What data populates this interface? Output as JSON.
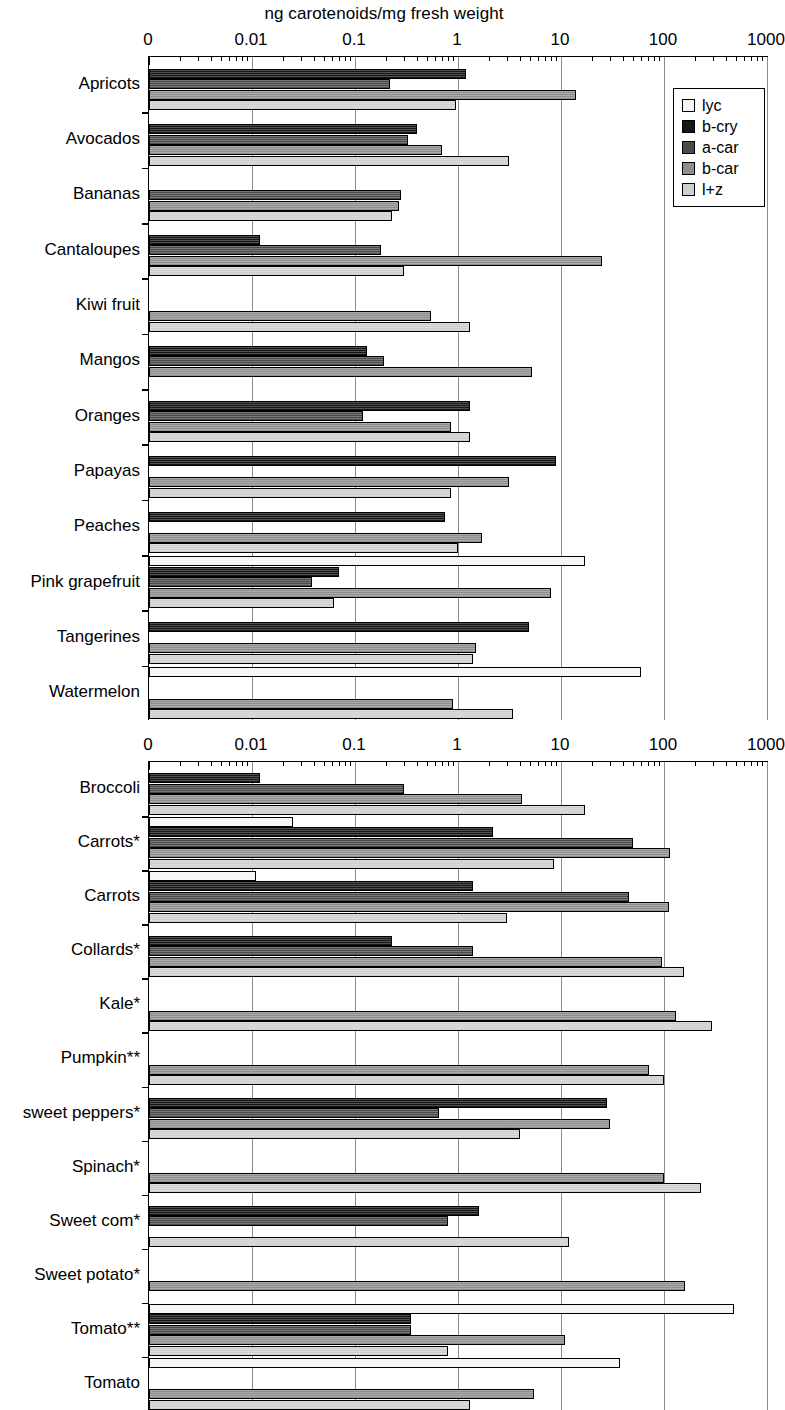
{
  "figure": {
    "axis_title": "ng carotenoids/mg fresh weight"
  },
  "legend": {
    "position": "top-right of upper panel",
    "entries": [
      {
        "key": "lyc",
        "label": "lyc",
        "color": "#f4f4f4"
      },
      {
        "key": "b-cry",
        "label": "b-cry",
        "color": "#161616"
      },
      {
        "key": "a-car",
        "label": "a-car",
        "color": "#4a4a4a"
      },
      {
        "key": "b-car",
        "label": "b-car",
        "color": "#8e8e8e"
      },
      {
        "key": "l+z",
        "label": "l+z",
        "color": "#cfcfcf"
      }
    ]
  },
  "chart_data": [
    {
      "id": "fruits",
      "type": "bar",
      "orientation": "horizontal",
      "title": "",
      "xlabel": "ng carotenoids/mg fresh weight",
      "ylabel": "",
      "xscale": "log",
      "xlim": [
        0.001,
        1000
      ],
      "xticks": [
        "0",
        "0.01",
        "0.1",
        "1",
        "10",
        "100",
        "1000"
      ],
      "xtick_values": [
        0.001,
        0.01,
        0.1,
        1,
        10,
        100,
        1000
      ],
      "grid": true,
      "legend": [
        "lyc",
        "b-cry",
        "a-car",
        "b-car",
        "l+z"
      ],
      "categories": [
        "Apricots",
        "Avocados",
        "Bananas",
        "Cantaloupes",
        "Kiwi fruit",
        "Mangos",
        "Oranges",
        "Papayas",
        "Peaches",
        "Pink grapefruit",
        "Tangerines",
        "Watermelon"
      ],
      "series": [
        {
          "name": "lyc",
          "values": [
            0,
            0,
            0,
            0,
            0,
            0,
            0,
            0,
            0,
            17,
            0,
            60
          ]
        },
        {
          "name": "b-cry",
          "values": [
            1.2,
            0.4,
            0,
            0.012,
            0,
            0.13,
            1.3,
            9.0,
            0.75,
            0.07,
            4.9,
            0
          ]
        },
        {
          "name": "a-car",
          "values": [
            0.22,
            0.33,
            0.28,
            0.18,
            0,
            0.19,
            0.12,
            0,
            0,
            0.038,
            0,
            0
          ]
        },
        {
          "name": "b-car",
          "values": [
            14,
            0.7,
            0.27,
            25,
            0.55,
            5.2,
            0.85,
            3.1,
            1.7,
            8.0,
            1.5,
            0.9
          ]
        },
        {
          "name": "l+z",
          "values": [
            0.95,
            3.1,
            0.23,
            0.3,
            1.3,
            0,
            1.3,
            0.85,
            1.0,
            0.062,
            1.4,
            3.4
          ]
        }
      ]
    },
    {
      "id": "vegetables",
      "type": "bar",
      "orientation": "horizontal",
      "title": "",
      "xlabel": "ng carotenoids/mg fresh weight",
      "ylabel": "",
      "xscale": "log",
      "xlim": [
        0.001,
        1000
      ],
      "xticks": [
        "0",
        "0.01",
        "0.1",
        "1",
        "10",
        "100",
        "1000"
      ],
      "xtick_values": [
        0.001,
        0.01,
        0.1,
        1,
        10,
        100,
        1000
      ],
      "grid": true,
      "legend": [
        "lyc",
        "b-cry",
        "a-car",
        "b-car",
        "l+z"
      ],
      "categories": [
        "Broccoli",
        "Carrots*",
        "Carrots",
        "Collards*",
        "Kale*",
        "Pumpkin**",
        "sweet peppers*",
        "Spinach*",
        "Sweet com*",
        "Sweet potato*",
        "Tomato**",
        "Tomato"
      ],
      "series": [
        {
          "name": "lyc",
          "values": [
            0,
            0.025,
            0.011,
            0,
            0,
            0,
            0,
            0,
            0,
            0,
            480,
            37
          ]
        },
        {
          "name": "b-cry",
          "values": [
            0.012,
            2.2,
            1.4,
            0.23,
            0,
            0,
            28,
            0,
            1.6,
            0,
            0.35,
            0
          ]
        },
        {
          "name": "a-car",
          "values": [
            0.3,
            50,
            46,
            1.4,
            0,
            0,
            0.65,
            0,
            0.8,
            0,
            0.35,
            0
          ]
        },
        {
          "name": "b-car",
          "values": [
            4.2,
            115,
            112,
            95,
            130,
            72,
            30,
            100,
            0,
            160,
            11,
            5.5
          ]
        },
        {
          "name": "l+z",
          "values": [
            17,
            8.5,
            3.0,
            155,
            290,
            100,
            4.0,
            230,
            12,
            0,
            0.8,
            1.3
          ]
        }
      ]
    }
  ]
}
